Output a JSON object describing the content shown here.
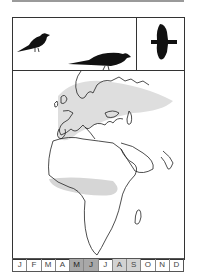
{
  "silhouettes": [
    {
      "name": "perched-bird",
      "pose": "perched-small"
    },
    {
      "name": "perched-bird-large",
      "pose": "perched-large"
    },
    {
      "name": "flying-bird",
      "pose": "flight"
    }
  ],
  "map": {
    "region": "Europe, Africa, Middle East",
    "breeding_range_color": "#dcdcdc",
    "wintering_range_color": "#d4d4d4"
  },
  "months": [
    {
      "label": "J",
      "shade": "none"
    },
    {
      "label": "F",
      "shade": "none"
    },
    {
      "label": "M",
      "shade": "none"
    },
    {
      "label": "A",
      "shade": "none"
    },
    {
      "label": "M",
      "shade": "dark"
    },
    {
      "label": "J",
      "shade": "dark"
    },
    {
      "label": "J",
      "shade": "none"
    },
    {
      "label": "A",
      "shade": "light"
    },
    {
      "label": "S",
      "shade": "light"
    },
    {
      "label": "O",
      "shade": "none"
    },
    {
      "label": "N",
      "shade": "none"
    },
    {
      "label": "D",
      "shade": "none"
    }
  ]
}
